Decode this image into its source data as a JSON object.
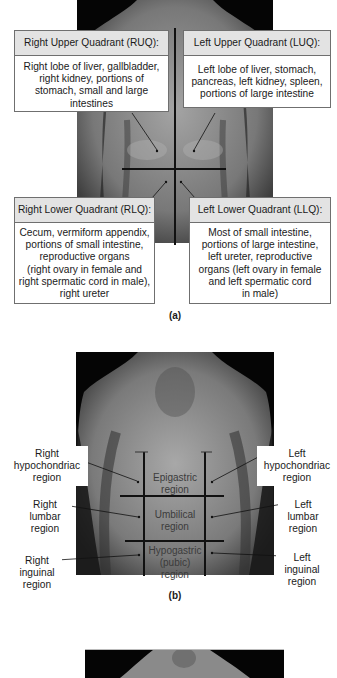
{
  "figure_a": {
    "label": "(a)",
    "quadrants": {
      "ruq": {
        "title": "Right Upper Quadrant  (RUQ):",
        "contents": "Right lobe of liver, gallbladder, right kidney, portions of stomach, small and large intestines"
      },
      "luq": {
        "title": "Left Upper Quadrant  (LUQ):",
        "contents": "Left lobe of liver, stomach, pancreas, left kidney, spleen, portions of large intestine"
      },
      "rlq": {
        "title": "Right Lower Quadrant  (RLQ):",
        "contents_lines": [
          "Cecum, vermiform appendix,",
          "portions of small intestine,",
          "reproductive organs",
          "(right ovary in female and",
          "right spermatic cord in male),",
          "right ureter"
        ]
      },
      "llq": {
        "title": "Left Lower Quadrant  (LLQ):",
        "contents_lines": [
          "Most of small intestine,",
          "portions of large intestine,",
          "left ureter, reproductive",
          "organs (left ovary in female",
          "and left spermatic cord",
          "in male)"
        ]
      }
    }
  },
  "figure_b": {
    "label": "(b)",
    "side_labels": {
      "right_hypochondriac": [
        "Right",
        "hypochondriac",
        "region"
      ],
      "left_hypochondriac": [
        "Left",
        "hypochondriac",
        "region"
      ],
      "right_lumbar": [
        "Right",
        "lumbar",
        "region"
      ],
      "left_lumbar": [
        "Left",
        "lumbar",
        "region"
      ],
      "right_inguinal": [
        "Right",
        "inguinal",
        "region"
      ],
      "left_inguinal": [
        "Left",
        "inguinal",
        "region"
      ]
    },
    "center_labels": {
      "epigastric": [
        "Epigastric",
        "region"
      ],
      "umbilical": [
        "Umbilical",
        "region"
      ],
      "hypogastric": [
        "Hypogastric",
        "(pubic)",
        "region"
      ]
    }
  },
  "colors": {
    "photo_bg": "#050505",
    "skin_light": "#9a9a9a",
    "skin_dark": "#5a5a5a",
    "box_header_bg": "#e3e3e3",
    "box_border": "#6f6f6f",
    "grid_line": "#111111"
  }
}
